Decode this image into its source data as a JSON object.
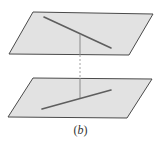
{
  "caption": {
    "open": "(",
    "letter": "b",
    "close": ")"
  },
  "colors": {
    "plane_fill": "#e2e2e2",
    "plane_edge": "#4a4a4a",
    "line": "#5e5e5e",
    "connector": "#8a8a8a"
  },
  "planes": [
    {
      "name": "upper-plane",
      "points": [
        [
          33,
          12
        ],
        [
          153,
          14
        ],
        [
          129,
          55
        ],
        [
          9,
          54
        ]
      ]
    },
    {
      "name": "lower-plane",
      "points": [
        [
          33,
          78
        ],
        [
          152,
          79
        ],
        [
          127,
          118
        ],
        [
          8,
          117
        ]
      ]
    }
  ],
  "lines": [
    {
      "name": "upper-line",
      "x1": 44,
      "y1": 17,
      "x2": 111,
      "y2": 48
    },
    {
      "name": "lower-line",
      "x1": 42,
      "y1": 109,
      "x2": 111,
      "y2": 90
    }
  ],
  "connector": {
    "x": 80,
    "y_top": 34,
    "y_upper_plane_edge": 55,
    "y_lower_plane_edge": 78,
    "y_bottom": 98
  }
}
